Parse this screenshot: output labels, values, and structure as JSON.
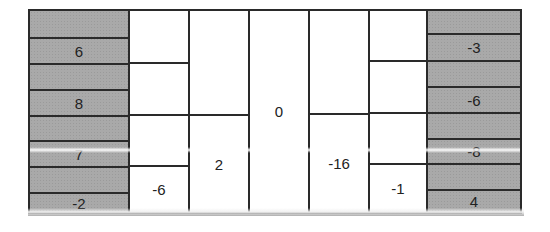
{
  "grid": {
    "left_column": {
      "fill": "#a9a9a9",
      "cells": [
        "",
        "6",
        "",
        "8",
        "",
        "7",
        "",
        "-2"
      ]
    },
    "col2": {
      "cells": [
        "",
        "",
        "",
        "-6"
      ]
    },
    "col3": {
      "cells": [
        "",
        "2"
      ]
    },
    "col4": {
      "cells": [
        "0"
      ]
    },
    "col5": {
      "cells": [
        "",
        "-16"
      ]
    },
    "col6": {
      "cells": [
        "",
        "",
        "",
        "-1"
      ]
    },
    "right_column": {
      "fill": "#a9a9a9",
      "cells": [
        "",
        "-3",
        "",
        "-6",
        "",
        "-8",
        "",
        "4"
      ]
    }
  }
}
